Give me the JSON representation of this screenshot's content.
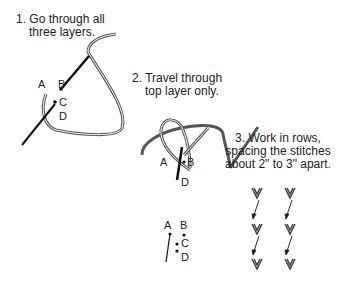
{
  "steps": [
    {
      "number": "1.",
      "line1": "1. Go through all",
      "line2": "three layers.",
      "points": [
        "A",
        "B",
        "C",
        "D"
      ]
    },
    {
      "number": "2.",
      "line1": "2. Travel through",
      "line2": "top layer only.",
      "points": [
        "A",
        "B",
        "D"
      ]
    },
    {
      "number": "3.",
      "line1": "3. Work in rows,",
      "line2": "spacing the stitches",
      "line3": "about 2\" to 3\" apart."
    }
  ],
  "detail_points": [
    "A",
    "B",
    "C",
    "D"
  ],
  "colors": {
    "thread": "#555555",
    "needle": "#111111",
    "text": "#222222"
  }
}
